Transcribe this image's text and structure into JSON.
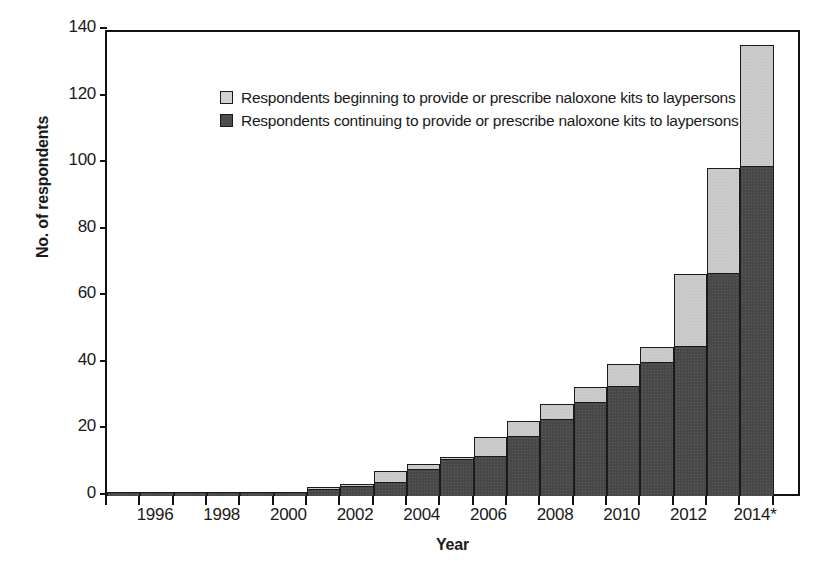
{
  "chart_data": {
    "type": "bar",
    "title": "",
    "subtitle": "",
    "stacked": true,
    "xlabel": "Year",
    "ylabel": "No. of respondents",
    "ylim": [
      0,
      140
    ],
    "ytick_step": 20,
    "yticks": [
      "0",
      "20",
      "40",
      "60",
      "80",
      "100",
      "120",
      "140"
    ],
    "grid": false,
    "legend_position": "top-left",
    "categories": [
      "1995",
      "1996",
      "1997",
      "1998",
      "1999",
      "2000",
      "2001",
      "2002",
      "2003",
      "2004",
      "2005",
      "2006",
      "2007",
      "2008",
      "2009",
      "2010",
      "2011",
      "2012",
      "2013",
      "2014*"
    ],
    "xtick_labels": [
      "1996",
      "1998",
      "2000",
      "2002",
      "2004",
      "2006",
      "2008",
      "2010",
      "2012",
      "2014*"
    ],
    "series": [
      {
        "name": "Respondents continuing to provide or prescribe naloxone kits to laypersons",
        "color": "#4a4a4a",
        "values": [
          1,
          1,
          1,
          1,
          1,
          1,
          2,
          3,
          4,
          8,
          11,
          12,
          18,
          23,
          28,
          33,
          40,
          45,
          67,
          99
        ]
      },
      {
        "name": "Respondents beginning to provide or prescribe naloxone kits to laypersons",
        "color": "#cdcdcd",
        "values": [
          0,
          0,
          0,
          0,
          0,
          0,
          1,
          1,
          4,
          2,
          1,
          6,
          5,
          5,
          5,
          7,
          5,
          22,
          32,
          37
        ]
      }
    ],
    "totals": [
      1,
      1,
      1,
      1,
      1,
      1,
      3,
      4,
      8,
      10,
      12,
      18,
      23,
      28,
      33,
      40,
      45,
      67,
      99,
      136
    ],
    "annotations": [
      "* 2014 data denoted with asterisk"
    ]
  },
  "legend": {
    "items": [
      {
        "label": "Respondents beginning to provide or prescribe naloxone kits to laypersons",
        "swatch": "light"
      },
      {
        "label": "Respondents continuing to provide or prescribe naloxone kits to laypersons",
        "swatch": "dark"
      }
    ]
  },
  "colors": {
    "light_fill": "#cdcdcd",
    "dark_fill": "#4a4a4a",
    "axis": "#111111",
    "background": "#ffffff"
  }
}
